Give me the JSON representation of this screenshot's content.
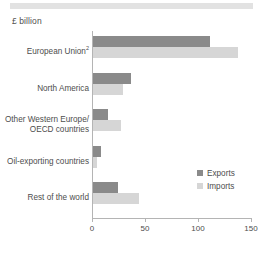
{
  "unit_label": "£ billion",
  "chart_data": {
    "type": "bar",
    "orientation": "horizontal",
    "title": "",
    "subtitle": "",
    "xlabel": "",
    "ylabel": "",
    "unit": "£ billion",
    "xlim": [
      0,
      150
    ],
    "xticks": [
      0,
      50,
      100,
      150
    ],
    "xtick_labels": [
      "0",
      "50",
      "100",
      "150"
    ],
    "grid": false,
    "legend_position": "right",
    "categories": [
      "European Union",
      "North America",
      "Other Western Europe/\nOECD countries",
      "Oil-exporting countries",
      "Rest of the world"
    ],
    "category_footnotes": [
      "2",
      "",
      "",
      "",
      ""
    ],
    "series": [
      {
        "name": "Exports",
        "color": "#8a8a8a",
        "values": [
          110,
          36,
          14,
          8,
          24
        ]
      },
      {
        "name": "Imports",
        "color": "#d6d6d6",
        "values": [
          137,
          28,
          26,
          4,
          43
        ]
      }
    ]
  },
  "legend": {
    "items": [
      {
        "label": "Exports",
        "color": "#8a8a8a"
      },
      {
        "label": "Imports",
        "color": "#d6d6d6"
      }
    ]
  },
  "colors": {
    "exports": "#8a8a8a",
    "imports": "#d6d6d6",
    "axis": "#b4b4b4",
    "text": "#4d4d4d",
    "top_band": "#e2e2e2"
  }
}
